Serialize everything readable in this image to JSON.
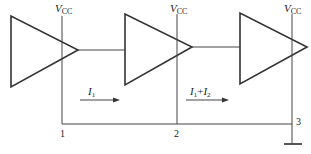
{
  "diagram": {
    "type": "circuit-schematic",
    "stroke_color": "#333333",
    "background": "#ffffff",
    "amplifiers": [
      {
        "id": "amp-1",
        "supply_label": "V",
        "supply_sub": "CC"
      },
      {
        "id": "amp-2",
        "supply_label": "V",
        "supply_sub": "CC"
      },
      {
        "id": "amp-3",
        "supply_label": "V",
        "supply_sub": "CC"
      }
    ],
    "nodes": [
      {
        "label": "1"
      },
      {
        "label": "2"
      },
      {
        "label": "3"
      }
    ],
    "currents": [
      {
        "label": "I",
        "sub": "1",
        "plus": "",
        "label2": "",
        "sub2": ""
      },
      {
        "label": "I",
        "sub": "1",
        "plus": "+",
        "label2": "I",
        "sub2": "2"
      }
    ],
    "ground": {
      "present": true
    }
  }
}
